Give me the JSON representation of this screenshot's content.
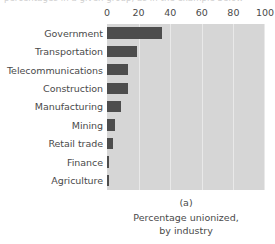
{
  "top_clipped_text": "percentages in a given group, as in the example below",
  "chart_data": {
    "type": "bar",
    "orientation": "horizontal",
    "title": "",
    "xlabel": "",
    "ylabel": "",
    "categories": [
      "Government",
      "Transportation",
      "Telecommunications",
      "Construction",
      "Manufacturing",
      "Mining",
      "Retail trade",
      "Finance",
      "Agriculture"
    ],
    "values": [
      35,
      19,
      13,
      13,
      9,
      5,
      4,
      1.5,
      1.5
    ],
    "xlim": [
      0,
      100
    ],
    "xticks": [
      0,
      20,
      40,
      60,
      80,
      100
    ],
    "xtick_labels": [
      "0",
      "20",
      "40",
      "60",
      "80",
      "100"
    ],
    "grid": true,
    "grid_axis": "x",
    "legend": false,
    "bar_color": "#4d4d4d",
    "plot_background": "#d6d6d6",
    "gridline_color": "#e9e9e9"
  },
  "caption": {
    "panel_id": "(a)",
    "line1": "Percentage unionized,",
    "line2": "by industry"
  }
}
